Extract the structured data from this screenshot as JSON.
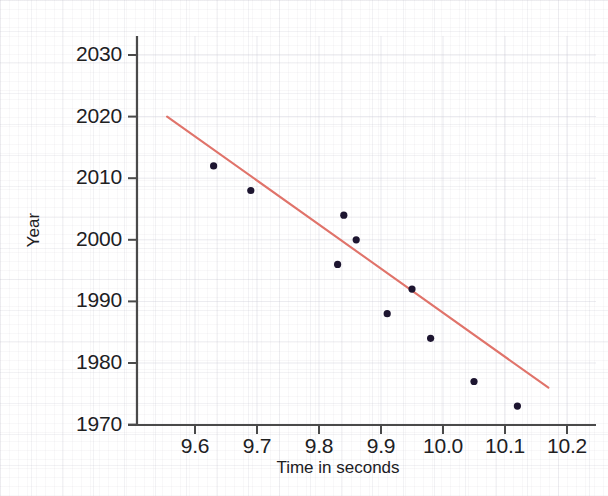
{
  "chart_data": {
    "type": "scatter",
    "title": "",
    "xlabel": "Time in seconds",
    "ylabel": "Year",
    "xlim": [
      9.55,
      10.23
    ],
    "ylim": [
      1970,
      2033
    ],
    "xticks": [
      "9.6",
      "9.7",
      "9.8",
      "9.9",
      "10.0",
      "10.1",
      "10.2"
    ],
    "xtick_values": [
      9.6,
      9.7,
      9.8,
      9.9,
      10.0,
      10.1,
      10.2
    ],
    "yticks": [
      "2030",
      "2020",
      "2010",
      "2000",
      "1990",
      "1980",
      "1970"
    ],
    "ytick_values": [
      2030,
      2020,
      2010,
      2000,
      1990,
      1980,
      1970
    ],
    "grid": true,
    "legend": "none",
    "point_color": "#1d1530",
    "line_color": "#e0736a",
    "axis_color": "#4a4a4a",
    "text_color": "#20201f",
    "points": [
      {
        "x": 9.63,
        "y": 2012
      },
      {
        "x": 9.69,
        "y": 2008
      },
      {
        "x": 9.84,
        "y": 2004
      },
      {
        "x": 9.86,
        "y": 2000
      },
      {
        "x": 9.83,
        "y": 1996
      },
      {
        "x": 9.95,
        "y": 1992
      },
      {
        "x": 9.91,
        "y": 1988
      },
      {
        "x": 9.98,
        "y": 1984
      },
      {
        "x": 10.05,
        "y": 1977
      },
      {
        "x": 10.12,
        "y": 1973
      }
    ],
    "trendline": {
      "label": "linear fit",
      "x_start": 9.555,
      "y_start": 2020,
      "x_end": 10.17,
      "y_end": 1976
    }
  },
  "axes": {
    "x_axis_name": "time-axis",
    "y_axis_name": "year-axis"
  }
}
